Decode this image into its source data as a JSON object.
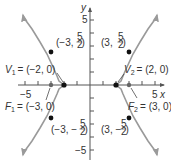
{
  "diagram": {
    "type": "hyperbola",
    "equation": "x^2/4 - y^2/5 = 1",
    "colors": {
      "curve": "#9a9a9a",
      "axis": "#555555",
      "point": "#111111",
      "focus_point": "#666666",
      "text": "#333333"
    },
    "axes": {
      "x_label": "x",
      "y_label": "y",
      "x_range": [
        -5,
        5
      ],
      "y_range": [
        -5,
        5
      ],
      "x_tick_labels": {
        "neg": "−5",
        "pos": "5"
      },
      "y_tick_labels": {
        "pos": "5",
        "neg": "−5"
      }
    },
    "points": {
      "v1": {
        "name": "V",
        "sub": "1",
        "coords": "= (−2, 0)",
        "x": -2,
        "y": 0
      },
      "v2": {
        "name": "V",
        "sub": "2",
        "coords": "= (2, 0)",
        "x": 2,
        "y": 0
      },
      "f1": {
        "name": "F",
        "sub": "1",
        "coords": "= (−3, 0)",
        "x": -3,
        "y": 0
      },
      "f2": {
        "name": "F",
        "sub": "2",
        "coords": "= (3, 0)",
        "x": 3,
        "y": 0
      },
      "p_ul": {
        "prefix": "(−3, ",
        "num": "5",
        "den": "2",
        "suffix": ")",
        "x": -3,
        "y": 2.5
      },
      "p_ur": {
        "prefix": "(3, ",
        "num": "5",
        "den": "2",
        "suffix": ")",
        "x": 3,
        "y": 2.5
      },
      "p_ll": {
        "prefix": "(−3, −",
        "num": "5",
        "den": "2",
        "suffix": ")",
        "x": -3,
        "y": -2.5
      },
      "p_lr": {
        "prefix": "(3, −",
        "num": "5",
        "den": "2",
        "suffix": ")",
        "x": 3,
        "y": -2.5
      }
    }
  }
}
